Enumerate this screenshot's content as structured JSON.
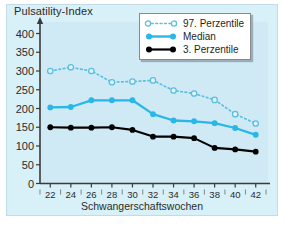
{
  "chart": {
    "title": "Pulsatility-Index",
    "xlabel": "Schwangerschaftswochen",
    "ylabel": ""
  },
  "legend": {
    "items": [
      {
        "label": "97. Perzentile",
        "key": "dotted-open-circle",
        "color": "#5bbfe0"
      },
      {
        "label": "Median",
        "key": "solid-filled-circle",
        "color": "#29b6e8"
      },
      {
        "label": "3. Perzentile",
        "key": "solid-filled-circle",
        "color": "#000000"
      }
    ]
  },
  "axes": {
    "yticks": [
      "400",
      "350",
      "300",
      "250",
      "200",
      "150",
      "100",
      "50",
      "0"
    ],
    "xticks": [
      "22",
      "24",
      "26",
      "28",
      "30",
      "32",
      "34",
      "36",
      "38",
      "40",
      "42"
    ]
  },
  "colors": {
    "panel": "#d8f0f8",
    "plot": "#cfeaf5",
    "p97": "#5bbfe0",
    "median": "#29b6e8",
    "p3": "#000000",
    "axis": "#3a3a3a"
  },
  "chart_data": {
    "type": "line",
    "title": "Pulsatility-Index",
    "xlabel": "Schwangerschaftswochen",
    "ylabel": "Pulsatility-Index",
    "x": [
      22,
      24,
      26,
      28,
      30,
      32,
      34,
      36,
      38,
      40,
      42
    ],
    "xlim": [
      21,
      43
    ],
    "ylim": [
      0,
      420
    ],
    "yticks": [
      0,
      50,
      100,
      150,
      200,
      250,
      300,
      350,
      400
    ],
    "grid": false,
    "legend_position": "top-right",
    "series": [
      {
        "name": "97. Perzentile",
        "style": "dotted",
        "marker": "open-circle",
        "color": "#5bbfe0",
        "values": [
          300,
          310,
          300,
          270,
          272,
          275,
          248,
          240,
          223,
          185,
          160
        ]
      },
      {
        "name": "Median",
        "style": "solid",
        "marker": "filled-circle",
        "color": "#29b6e8",
        "values": [
          203,
          204,
          222,
          222,
          222,
          185,
          168,
          166,
          161,
          148,
          130
        ]
      },
      {
        "name": "3. Perzentile",
        "style": "solid",
        "marker": "filled-circle",
        "color": "#000000",
        "values": [
          150,
          149,
          149,
          150,
          143,
          125,
          125,
          121,
          95,
          91,
          85
        ]
      }
    ]
  }
}
